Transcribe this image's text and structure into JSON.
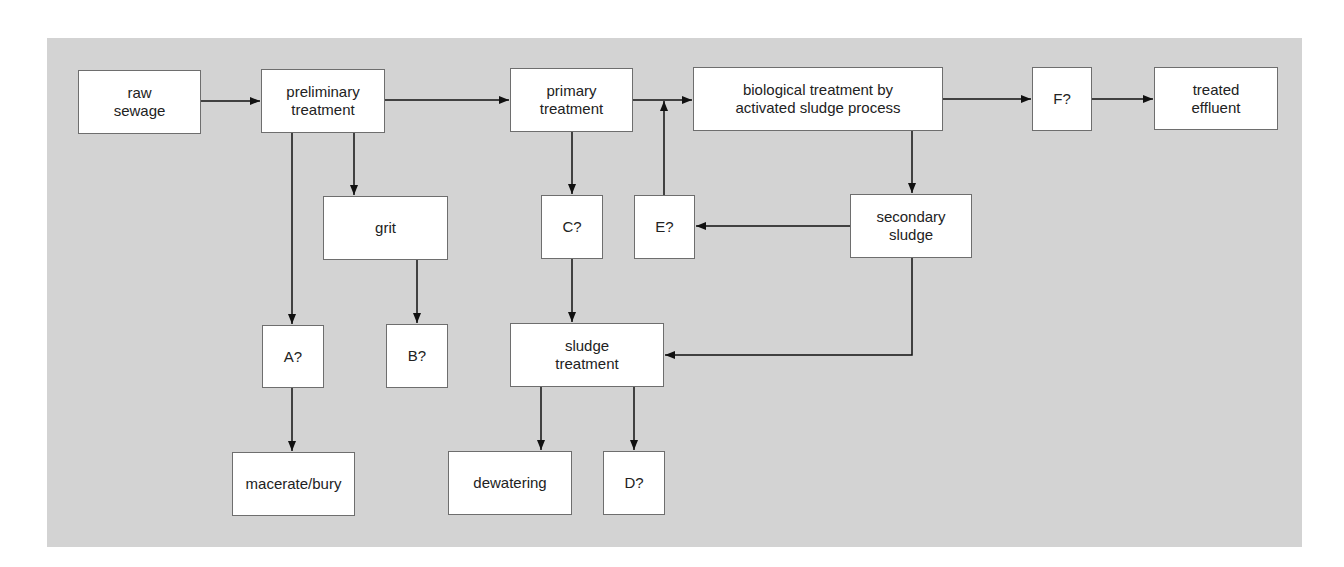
{
  "diagram": {
    "title": "",
    "nodes": [
      {
        "id": "raw_sewage",
        "label": "raw\nsewage"
      },
      {
        "id": "preliminary",
        "label": "preliminary\ntreatment"
      },
      {
        "id": "primary",
        "label": "primary\ntreatment"
      },
      {
        "id": "biological",
        "label": "biological treatment by\nactivated sludge process"
      },
      {
        "id": "F",
        "label": "F?"
      },
      {
        "id": "treated_effluent",
        "label": "treated\neffluent"
      },
      {
        "id": "grit",
        "label": "grit"
      },
      {
        "id": "C",
        "label": "C?"
      },
      {
        "id": "E",
        "label": "E?"
      },
      {
        "id": "secondary_sludge",
        "label": "secondary\nsludge"
      },
      {
        "id": "A",
        "label": "A?"
      },
      {
        "id": "B",
        "label": "B?"
      },
      {
        "id": "sludge_treatment",
        "label": "sludge\ntreatment"
      },
      {
        "id": "macerate_bury",
        "label": "macerate/bury"
      },
      {
        "id": "dewatering",
        "label": "dewatering"
      },
      {
        "id": "D",
        "label": "D?"
      }
    ],
    "edges": [
      {
        "from": "raw_sewage",
        "to": "preliminary"
      },
      {
        "from": "preliminary",
        "to": "primary"
      },
      {
        "from": "primary",
        "to": "biological"
      },
      {
        "from": "biological",
        "to": "F"
      },
      {
        "from": "F",
        "to": "treated_effluent"
      },
      {
        "from": "preliminary",
        "to": "grit"
      },
      {
        "from": "preliminary",
        "to": "A"
      },
      {
        "from": "grit",
        "to": "B"
      },
      {
        "from": "A",
        "to": "macerate_bury"
      },
      {
        "from": "primary",
        "to": "C"
      },
      {
        "from": "C",
        "to": "sludge_treatment"
      },
      {
        "from": "biological",
        "to": "secondary_sludge"
      },
      {
        "from": "secondary_sludge",
        "to": "E"
      },
      {
        "from": "E",
        "to": "biological"
      },
      {
        "from": "secondary_sludge",
        "to": "sludge_treatment"
      },
      {
        "from": "sludge_treatment",
        "to": "dewatering"
      },
      {
        "from": "sludge_treatment",
        "to": "D"
      }
    ],
    "colors": {
      "panel": "#d3d3d3",
      "box": "#ffffff",
      "border": "#6e6e6e",
      "line": "#111111"
    }
  }
}
